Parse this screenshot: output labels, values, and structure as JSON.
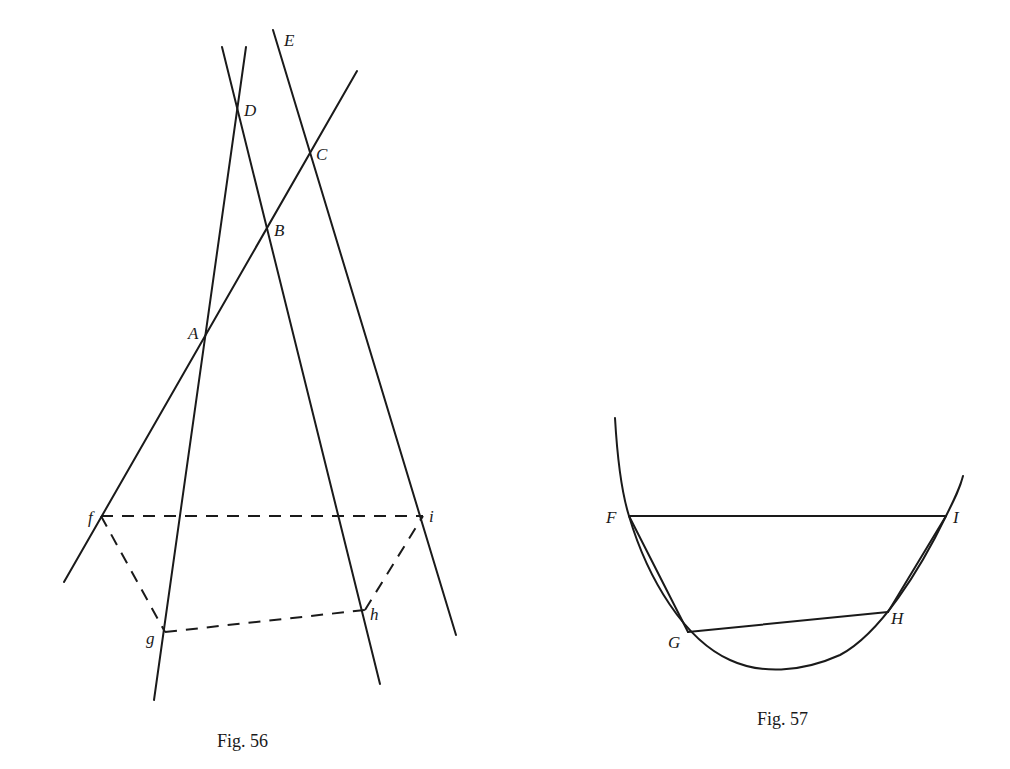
{
  "figures": [
    {
      "caption": "Fig. 56",
      "labels": {
        "D": "D",
        "E": "E",
        "C": "C",
        "B": "B",
        "A": "A",
        "f": "f",
        "i": "i",
        "g": "g",
        "h": "h"
      },
      "points": {
        "D": [
          237,
          112
        ],
        "C": [
          311,
          152
        ],
        "B": [
          267,
          228
        ],
        "A": [
          204,
          339
        ],
        "f": [
          101,
          516
        ],
        "i": [
          423,
          516
        ],
        "g": [
          165,
          632
        ],
        "h": [
          365,
          610
        ]
      }
    },
    {
      "caption": "Fig. 57",
      "labels": {
        "F": "F",
        "I": "I",
        "G": "G",
        "H": "H"
      },
      "points": {
        "F": [
          629,
          516
        ],
        "I": [
          946,
          516
        ],
        "G": [
          688,
          632
        ],
        "H": [
          888,
          612
        ]
      }
    }
  ]
}
